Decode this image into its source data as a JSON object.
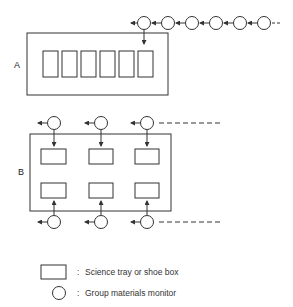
{
  "diagram": {
    "arrangement_a": {
      "label": "A",
      "trays": 6,
      "monitors": 6
    },
    "arrangement_b": {
      "label": "B",
      "trays": 6,
      "monitors_top": 3,
      "monitors_bottom": 3
    },
    "legend": {
      "items": [
        {
          "symbol": "rectangle",
          "separator": ":",
          "text": "Science tray or shoe box"
        },
        {
          "symbol": "circle",
          "separator": ":",
          "text": "Group materials monitor"
        }
      ]
    },
    "colors": {
      "stroke": "#333333",
      "background": "#ffffff"
    }
  }
}
